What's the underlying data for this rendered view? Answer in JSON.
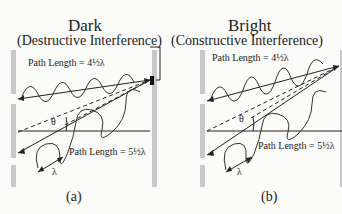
{
  "panels": [
    {
      "id": "a",
      "title": "Dark",
      "subtitle": "(Destructive Interference)",
      "top_path_label": "Path Length = 4½λ",
      "bottom_path_label": "Path Length = 5½λ",
      "angle_label": "θ",
      "wavelength_label": "λ",
      "caption": "(a)"
    },
    {
      "id": "b",
      "title": "Bright",
      "subtitle": "(Constructive Interference)",
      "top_path_label": "Path Length = 4½λ",
      "bottom_path_label": "Path Length = 5½λ",
      "angle_label": "θ",
      "wavelength_label": "λ",
      "caption": "(b)"
    }
  ],
  "colors": {
    "barrier": "#c8c8c8",
    "ink": "#222222",
    "background": "#fbfbf9"
  }
}
